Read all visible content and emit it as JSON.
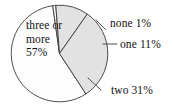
{
  "chart_data": {
    "type": "pie",
    "title": "",
    "categories": [
      "none",
      "one",
      "two",
      "three or more"
    ],
    "values": [
      1,
      11,
      31,
      57
    ],
    "unit": "%",
    "labels": [
      "none 1%",
      "one 11%",
      "two 31%",
      "three or more 57%"
    ],
    "legend": "none",
    "grid": false,
    "colors": [
      "#ffffff",
      "#e2e2e2",
      "#e2e2e2",
      "#fdfdfd"
    ],
    "outline_color": "#3a3a3a",
    "start_angle_deg": -8,
    "direction": "clockwise",
    "slices": [
      {
        "name": "none",
        "value": 1,
        "label": "none 1%",
        "fill": "#ffffff",
        "label_placement": "outside-right"
      },
      {
        "name": "one",
        "value": 11,
        "label": "one 11%",
        "fill": "#e2e2e2",
        "label_placement": "outside-right"
      },
      {
        "name": "two",
        "value": 31,
        "label": "two 31%",
        "fill": "#e2e2e2",
        "label_placement": "outside-bottom-right"
      },
      {
        "name": "three or more",
        "value": 57,
        "label": "three or more 57%",
        "fill": "#fdfdfd",
        "label_placement": "inside"
      }
    ]
  },
  "labels": {
    "none": "none 1%",
    "one": "one 11%",
    "two": "two 31%",
    "three_or_more_line1": "three or",
    "three_or_more_line2": "more",
    "three_or_more_line3": "57%"
  }
}
